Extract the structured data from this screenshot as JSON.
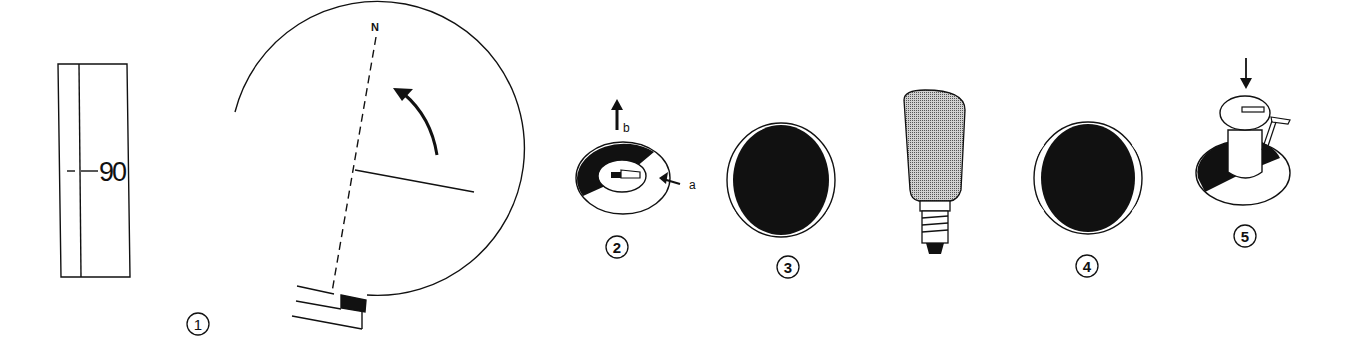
{
  "figure": {
    "colors": {
      "ink": "#111111",
      "paper": "#ffffff",
      "bulb_fill": "#9a9a9a"
    },
    "panels": [
      {
        "id": 1,
        "step_label": "1",
        "description": "Compass bearing dial with scale marker"
      },
      {
        "id": 2,
        "step_label": "2",
        "description": "Ring with pointer; arrows a and b"
      },
      {
        "id": 3,
        "step_label": "3",
        "description": "Dark disc with two white side gaps"
      },
      {
        "id": 4,
        "step_label": "4",
        "description": "Light bulb and dark disc with side gaps"
      },
      {
        "id": 5,
        "step_label": "5",
        "description": "Cylinder with lever pressed down into ring"
      }
    ],
    "scale": {
      "value_label": "90"
    },
    "compass": {
      "north_label": "N"
    },
    "arrows": {
      "a_label": "a",
      "b_label": "b"
    }
  }
}
